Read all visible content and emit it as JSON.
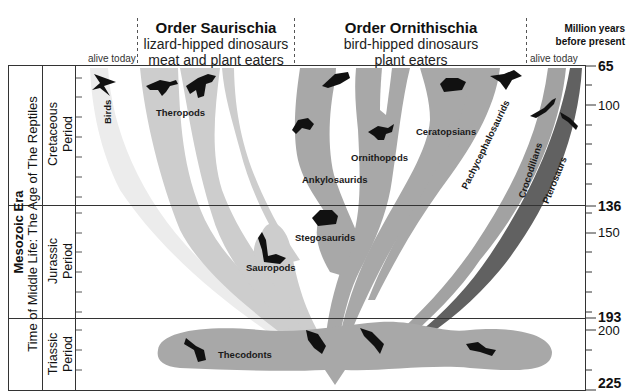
{
  "header": {
    "saurischia": {
      "title": "Order Saurischia",
      "line1": "lizard-hipped dinosaurs",
      "line2": "meat and plant eaters"
    },
    "ornithischia": {
      "title": "Order Ornithischia",
      "line1": "bird-hipped dinosaurs",
      "line2": "plant eaters"
    },
    "alive_today_left": "alive today",
    "alive_today_right": "alive today",
    "axis_title_line1": "Million years",
    "axis_title_line2": "before present"
  },
  "era": {
    "title": "Mesozoic Era",
    "subtitle": "Time of Middle Life: The Age of The Reptiles"
  },
  "periods": [
    {
      "name_line1": "Cretaceous",
      "name_line2": "Period",
      "start": 136,
      "end": 65
    },
    {
      "name_line1": "Jurassic",
      "name_line2": "Period",
      "start": 193,
      "end": 136
    },
    {
      "name_line1": "Triassic",
      "name_line2": "Period",
      "start": 225,
      "end": 193
    }
  ],
  "axis": {
    "labels": [
      {
        "value": "65",
        "bold": true
      },
      {
        "value": "100",
        "bold": false
      },
      {
        "value": "136",
        "bold": true
      },
      {
        "value": "150",
        "bold": false
      },
      {
        "value": "193",
        "bold": true
      },
      {
        "value": "200",
        "bold": false
      },
      {
        "value": "225",
        "bold": true
      }
    ]
  },
  "clades": {
    "birds": "Birds",
    "theropods": "Theropods",
    "sauropods": "Sauropods",
    "stegosaurids": "Stegosaurids",
    "ankylosaurids": "Ankylosaurids",
    "ornithopods": "Ornithopods",
    "ceratopsians": "Ceratopsians",
    "pachycephalosaurids": "Pachycephalosaurids",
    "crocodilians": "Crocodilians",
    "pterosaurs": "Pterosaurs",
    "thecodonts": "Thecodonts"
  },
  "colors": {
    "light_gray": "#c9c9c9",
    "mid_gray": "#a9a9a9",
    "dark_gray": "#6e6e6e",
    "silhouette": "#111111",
    "line": "#333333"
  }
}
